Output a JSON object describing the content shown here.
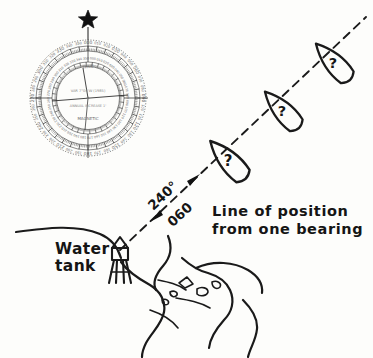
{
  "figure": {
    "title": "Line of position from one bearing",
    "background_color": "#fdfdfb",
    "ink_color": "#1a1a1a",
    "style": "hand-drawn pen-and-ink nautical chart illustration"
  },
  "compass_rose": {
    "name": "compass-rose",
    "north_star_marker": "★",
    "outer_ring_label": "TRUE",
    "inner_ring_label": "MAGNETIC",
    "center_text_line1": "VAR 7°00'W (1985)",
    "center_text_line2": "ANNUAL INCREASE 1'",
    "cardinal_degrees": [
      "000",
      "090",
      "180",
      "270"
    ],
    "tick_labels": [
      "010",
      "020",
      "030",
      "040",
      "050",
      "060",
      "070",
      "080",
      "090",
      "100",
      "110",
      "120",
      "130",
      "140",
      "150",
      "160",
      "170",
      "180",
      "190",
      "200",
      "210",
      "220",
      "230",
      "240",
      "250",
      "260",
      "270",
      "280",
      "290",
      "300",
      "310",
      "320",
      "330",
      "340",
      "350",
      "000"
    ]
  },
  "bearing": {
    "name": "bearing-line",
    "forward_label": "240°",
    "reciprocal_label": "060",
    "line_style": "dashed",
    "arrowheads": 2
  },
  "annotation": {
    "line1": "Line of position",
    "line2": "from one bearing"
  },
  "landmark": {
    "label_line1": "Water",
    "label_line2": "tank",
    "icon": "water-tower-icon"
  },
  "vessels": [
    {
      "id": "vessel-near",
      "mark": "?"
    },
    {
      "id": "vessel-middle",
      "mark": "?"
    },
    {
      "id": "vessel-far",
      "mark": "?"
    }
  ],
  "coastline": {
    "name": "coastline-and-estuary",
    "features": [
      "shoreline",
      "river",
      "islands"
    ]
  }
}
